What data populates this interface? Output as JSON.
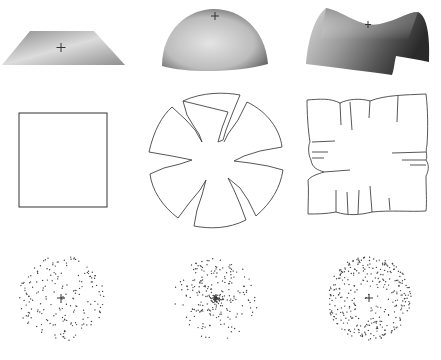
{
  "figure": {
    "rows": [
      {
        "name": "surfaces",
        "items": [
          "plane",
          "dome",
          "saddle"
        ]
      },
      {
        "name": "flattened",
        "items": [
          "square",
          "split-disk",
          "ruffled-square"
        ]
      },
      {
        "name": "point-distributions",
        "items": [
          "uniform",
          "center-dense",
          "edge-dense"
        ]
      }
    ],
    "colors": {
      "stroke": "#333333",
      "dot": "#444444",
      "background": "#ffffff"
    }
  }
}
